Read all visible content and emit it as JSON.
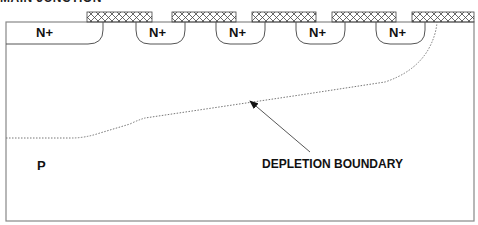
{
  "title": "MAIN JUNCTION",
  "diagram": {
    "type": "semiconductor-cross-section",
    "substrate_label": "P",
    "annotation": "DEPLETION BOUNDARY",
    "regions": [
      {
        "label": "N+"
      },
      {
        "label": "N+"
      },
      {
        "label": "N+"
      },
      {
        "label": "N+"
      },
      {
        "label": "N+"
      }
    ],
    "gates_count": 5,
    "colors": {
      "outline": "#555555",
      "hatch": "#444444",
      "boundary": "#777777",
      "text": "#111111"
    }
  }
}
